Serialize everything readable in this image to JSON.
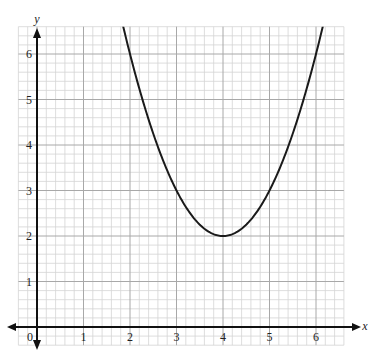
{
  "chart_data": {
    "type": "line",
    "title": "",
    "xlabel": "x",
    "ylabel": "y",
    "xlim": [
      -0.4,
      6.6
    ],
    "ylim": [
      -0.4,
      6.6
    ],
    "grid": true,
    "minor_per_unit": 5,
    "x_ticks": [
      "1",
      "2",
      "3",
      "4",
      "5",
      "6"
    ],
    "y_ticks": [
      "1",
      "2",
      "3",
      "4",
      "5",
      "6"
    ],
    "origin_label": "0",
    "series": [
      {
        "name": "parabola",
        "equation": "y = (x - 4)^2 + 2",
        "vertex": [
          4,
          2
        ],
        "points": [
          [
            1.8,
            6.84
          ],
          [
            2,
            6
          ],
          [
            2.5,
            4.25
          ],
          [
            3,
            3
          ],
          [
            3.5,
            2.25
          ],
          [
            4,
            2
          ],
          [
            4.5,
            2.25
          ],
          [
            5,
            3
          ],
          [
            5.5,
            4.25
          ],
          [
            6,
            6
          ],
          [
            6.2,
            6.84
          ]
        ]
      }
    ]
  },
  "labels": {
    "x_axis": "x",
    "y_axis": "y",
    "origin": "0"
  },
  "colors": {
    "minor_grid": "#d4d4d4",
    "major_grid": "#a8a8a8",
    "axis": "#111111",
    "curve": "#1a1a1a"
  }
}
